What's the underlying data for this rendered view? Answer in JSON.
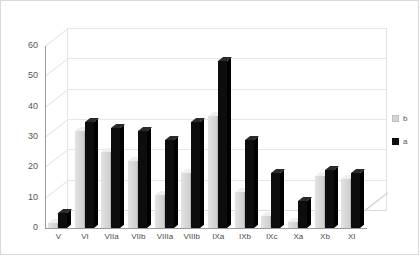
{
  "chart_data": {
    "type": "bar",
    "title": "",
    "subtitle": "",
    "xlabel": "",
    "ylabel": "",
    "ylim": [
      0,
      60
    ],
    "yticks": [
      0,
      10,
      20,
      30,
      40,
      50,
      60
    ],
    "grid": true,
    "legend_position": "right",
    "style": "3d-clustered-column",
    "categories": [
      "V",
      "VI",
      "VIIa",
      "VIIb",
      "VIIIa",
      "VIIIb",
      "IXa",
      "IXb",
      "IXc",
      "Xa",
      "Xb",
      "XI"
    ],
    "series": [
      {
        "name": "b",
        "color": "#d4d4d4",
        "values": [
          1.5,
          32,
          25,
          22,
          11,
          18,
          37,
          12,
          4,
          2,
          17,
          16
        ]
      },
      {
        "name": "a",
        "color": "#0d0d0d",
        "values": [
          5,
          35,
          33,
          32,
          29,
          35,
          55,
          29,
          18,
          9,
          19,
          18
        ]
      }
    ]
  },
  "axis": {
    "y_tick_labels": [
      "60",
      "50",
      "40",
      "30",
      "20",
      "10",
      "0"
    ],
    "x_tick_labels": [
      "V",
      "VI",
      "VIIa",
      "VIIb",
      "VIIIa",
      "VIIIb",
      "IXa",
      "IXb",
      "IXc",
      "Xa",
      "Xb",
      "XI"
    ]
  },
  "legend": {
    "items": [
      {
        "label": "b",
        "swatch": "light-gray"
      },
      {
        "label": "a",
        "swatch": "black"
      }
    ]
  },
  "colors": {
    "series_b": "#d4d4d4",
    "series_a": "#0d0d0d",
    "gridline": "#e6e6e6",
    "axis": "#9a9a9a",
    "background": "#ffffff",
    "frame": "#d9d9d9"
  }
}
